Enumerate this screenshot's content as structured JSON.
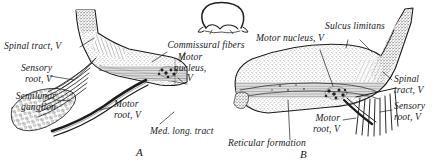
{
  "figure": {
    "background_color": "#ffffff",
    "ink_color": "#1a1a1a",
    "panel_labels": [
      {
        "id": "A",
        "text": "A"
      },
      {
        "id": "B",
        "text": "B"
      }
    ]
  },
  "labels": {
    "spinal_tract_left": "Spinal tract, V",
    "sensory_root_left": "Sensory\nroot, V",
    "semilunar_ganglion": "Semilunar\nganglion",
    "motor_root_left": "Motor\nroot, V",
    "commissural_fibers": "Commissural fibers",
    "motor_nucleus_center": "Motor\nnucleus,\nV",
    "med_long_tract": "Med. long. tract",
    "sulcus_limitans": "Sulcus limitans",
    "motor_nucleus_right": "Motor nucleus, V",
    "spinal_tract_right": "Spinal\ntract, V",
    "sensory_root_right": "Sensory\nroot, V",
    "motor_root_right": "Motor\nroot, V",
    "reticular_formation": "Reticular formation"
  },
  "icons": {
    "inset": "brainstem-cross-section-inset"
  }
}
